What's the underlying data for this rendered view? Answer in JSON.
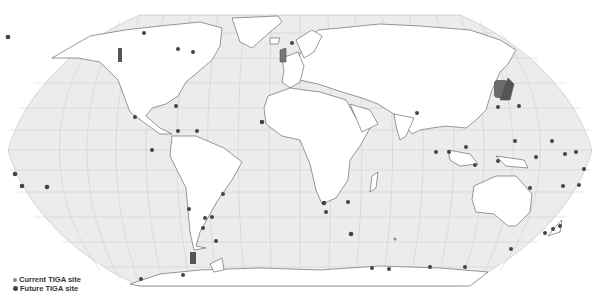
{
  "map": {
    "projection": "Robinson",
    "ocean_color": "#ececec",
    "land_color": "#ffffff",
    "border_color": "#555555",
    "graticule_color": "#c8c8c8",
    "site_current_color": "#8a8a8a",
    "site_future_color": "#444444"
  },
  "legend": {
    "items": [
      {
        "label": "Current TIGA site",
        "marker": "current"
      },
      {
        "label": "Future TIGA site",
        "marker": "future"
      }
    ]
  },
  "sites": [
    {
      "x": 8,
      "y": 37,
      "r": 2.3,
      "type": "future"
    },
    {
      "x": 144,
      "y": 33,
      "r": 2,
      "type": "future"
    },
    {
      "x": 178,
      "y": 49,
      "r": 2,
      "type": "future"
    },
    {
      "x": 193,
      "y": 52,
      "r": 2,
      "type": "future"
    },
    {
      "x": 292,
      "y": 43,
      "r": 2,
      "type": "future"
    },
    {
      "x": 176,
      "y": 106,
      "r": 2,
      "type": "future"
    },
    {
      "x": 135,
      "y": 117,
      "r": 2,
      "type": "future"
    },
    {
      "x": 262,
      "y": 122,
      "r": 2.3,
      "type": "future"
    },
    {
      "x": 178,
      "y": 131,
      "r": 2,
      "type": "future"
    },
    {
      "x": 197,
      "y": 131,
      "r": 2,
      "type": "future"
    },
    {
      "x": 152,
      "y": 150,
      "r": 2,
      "type": "future"
    },
    {
      "x": 15,
      "y": 174,
      "r": 2.3,
      "type": "future"
    },
    {
      "x": 22,
      "y": 186,
      "r": 2.3,
      "type": "future"
    },
    {
      "x": 47,
      "y": 187,
      "r": 2.3,
      "type": "future"
    },
    {
      "x": 223,
      "y": 194,
      "r": 2,
      "type": "future"
    },
    {
      "x": 189,
      "y": 209,
      "r": 2,
      "type": "future"
    },
    {
      "x": 205,
      "y": 218,
      "r": 2,
      "type": "future"
    },
    {
      "x": 212,
      "y": 217,
      "r": 2,
      "type": "future"
    },
    {
      "x": 203,
      "y": 228,
      "r": 2,
      "type": "future"
    },
    {
      "x": 216,
      "y": 241,
      "r": 2,
      "type": "future"
    },
    {
      "x": 141,
      "y": 279,
      "r": 2,
      "type": "future"
    },
    {
      "x": 183,
      "y": 275,
      "r": 2,
      "type": "future"
    },
    {
      "x": 324,
      "y": 203,
      "r": 2.3,
      "type": "future"
    },
    {
      "x": 348,
      "y": 202,
      "r": 2,
      "type": "future"
    },
    {
      "x": 326,
      "y": 212,
      "r": 2,
      "type": "future"
    },
    {
      "x": 351,
      "y": 234,
      "r": 2.3,
      "type": "future"
    },
    {
      "x": 395,
      "y": 239,
      "r": 1.5,
      "type": "current"
    },
    {
      "x": 372,
      "y": 268,
      "r": 2,
      "type": "future"
    },
    {
      "x": 389,
      "y": 269,
      "r": 2,
      "type": "future"
    },
    {
      "x": 430,
      "y": 267,
      "r": 2,
      "type": "future"
    },
    {
      "x": 465,
      "y": 267,
      "r": 2,
      "type": "future"
    },
    {
      "x": 498,
      "y": 161,
      "r": 2,
      "type": "future"
    },
    {
      "x": 475,
      "y": 165,
      "r": 2,
      "type": "future"
    },
    {
      "x": 536,
      "y": 157,
      "r": 2,
      "type": "future"
    },
    {
      "x": 565,
      "y": 154,
      "r": 2,
      "type": "future"
    },
    {
      "x": 576,
      "y": 152,
      "r": 2,
      "type": "future"
    },
    {
      "x": 584,
      "y": 169,
      "r": 2,
      "type": "future"
    },
    {
      "x": 579,
      "y": 185,
      "r": 2,
      "type": "future"
    },
    {
      "x": 563,
      "y": 186,
      "r": 2,
      "type": "future"
    },
    {
      "x": 530,
      "y": 188,
      "r": 2,
      "type": "future"
    },
    {
      "x": 511,
      "y": 249,
      "r": 2,
      "type": "future"
    },
    {
      "x": 545,
      "y": 233,
      "r": 2,
      "type": "future"
    },
    {
      "x": 553,
      "y": 229,
      "r": 2,
      "type": "future"
    },
    {
      "x": 560,
      "y": 226,
      "r": 2,
      "type": "future"
    },
    {
      "x": 498,
      "y": 107,
      "r": 2,
      "type": "future"
    },
    {
      "x": 519,
      "y": 106,
      "r": 2,
      "type": "future"
    },
    {
      "x": 515,
      "y": 141,
      "r": 2,
      "type": "future"
    },
    {
      "x": 552,
      "y": 141,
      "r": 2,
      "type": "future"
    },
    {
      "x": 417,
      "y": 113,
      "r": 2,
      "type": "future"
    },
    {
      "x": 436,
      "y": 152,
      "r": 2,
      "type": "future"
    },
    {
      "x": 449,
      "y": 152,
      "r": 2,
      "type": "future"
    },
    {
      "x": 466,
      "y": 147,
      "r": 2,
      "type": "future"
    }
  ]
}
